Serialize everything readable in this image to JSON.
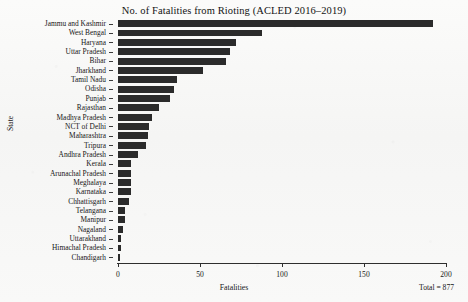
{
  "chart_data": {
    "type": "bar",
    "orientation": "horizontal",
    "title": "No. of Fatalities from Rioting (ACLED 2016–2019)",
    "xlabel": "Fatalities",
    "ylabel": "State",
    "xlim": [
      0,
      200
    ],
    "xticks": [
      0,
      50,
      100,
      150,
      200
    ],
    "xtick_labels": [
      "0",
      "50",
      "100",
      "150",
      "200"
    ],
    "grid": false,
    "legend": null,
    "bar_color": "#2b2b2b",
    "background_color": "#f8f8f7",
    "annotations": [
      {
        "text": "Total = 877",
        "position": "bottom-right"
      }
    ],
    "categories": [
      "Jammu and Kashmir",
      "West Bengal",
      "Haryana",
      "Uttar Pradesh",
      "Bihar",
      "Jharkhand",
      "Tamil Nadu",
      "Odisha",
      "Punjab",
      "Rajasthan",
      "Madhya Pradesh",
      "NCT of Delhi",
      "Maharashtra",
      "Tripura",
      "Andhra Pradesh",
      "Kerala",
      "Arunachal Pradesh",
      "Meghalaya",
      "Karnataka",
      "Chhattisgarh",
      "Telangana",
      "Manipur",
      "Nagaland",
      "Uttarakhand",
      "Himachal Pradesh",
      "Chandigarh"
    ],
    "values": [
      192,
      88,
      72,
      68,
      66,
      52,
      36,
      34,
      32,
      25,
      21,
      19,
      18,
      17,
      12,
      8,
      8,
      8,
      8,
      7,
      4,
      4,
      3,
      2,
      2,
      1
    ],
    "total": 877
  }
}
